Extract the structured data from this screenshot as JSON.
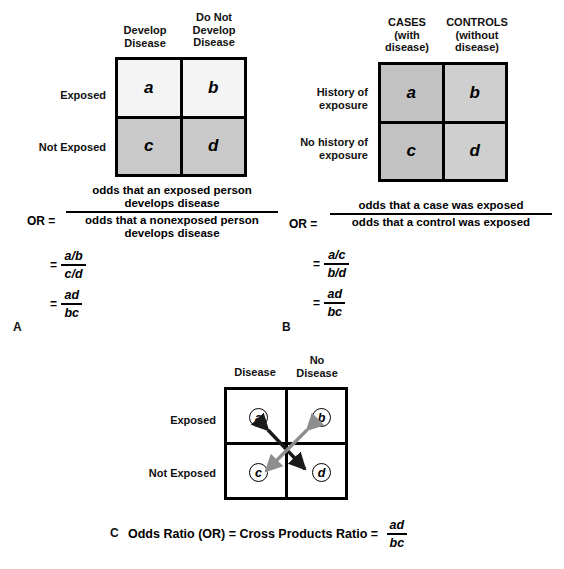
{
  "figure": {
    "panels": [
      {
        "id": "A",
        "letter": "A",
        "table": {
          "col_headers": [
            "Develop\nDisease",
            "Do Not\nDevelop\nDisease"
          ],
          "col_header_lines": [
            [
              "Develop",
              "Disease"
            ],
            [
              "Do Not",
              "Develop",
              "Disease"
            ]
          ],
          "row_headers": [
            "Exposed",
            "Not Exposed"
          ],
          "cells": [
            [
              "a",
              "b"
            ],
            [
              "c",
              "d"
            ]
          ],
          "cell_colors": [
            [
              "#f4f4f4",
              "#f4f4f4"
            ],
            [
              "#c9c9c9",
              "#c9c9c9"
            ]
          ]
        },
        "formula": {
          "or_label": "OR  =",
          "numerator_lines": [
            "odds that an exposed person",
            "develops disease"
          ],
          "denominator_lines": [
            "odds that a nonexposed person",
            "develops disease"
          ],
          "steps": [
            {
              "eq": "=",
              "num": "a/b",
              "den": "c/d"
            },
            {
              "eq": "=",
              "num": "ad",
              "den": "bc"
            }
          ]
        }
      },
      {
        "id": "B",
        "letter": "B",
        "table": {
          "col_header_lines": [
            [
              "CASES",
              "(with",
              "disease)"
            ],
            [
              "CONTROLS",
              "(without",
              "disease)"
            ]
          ],
          "row_header_lines": [
            [
              "History of",
              "exposure"
            ],
            [
              "No history of",
              "exposure"
            ]
          ],
          "cells": [
            [
              "a",
              "b"
            ],
            [
              "c",
              "d"
            ]
          ],
          "cell_colors": [
            [
              "#c2c2c2",
              "#cfcfcf"
            ],
            [
              "#c2c2c2",
              "#cfcfcf"
            ]
          ]
        },
        "formula": {
          "or_label": "OR  =",
          "numerator_lines": [
            "odds that a case was exposed"
          ],
          "denominator_lines": [
            "odds that a control was exposed"
          ],
          "steps": [
            {
              "eq": "=",
              "num": "a/c",
              "den": "b/d"
            },
            {
              "eq": "=",
              "num": "ad",
              "den": "bc"
            }
          ]
        }
      },
      {
        "id": "C",
        "letter": "C",
        "table": {
          "col_header_lines": [
            [
              "Disease"
            ],
            [
              "No",
              "Disease"
            ]
          ],
          "row_headers": [
            "Exposed",
            "Not Exposed"
          ],
          "cells": [
            [
              "a",
              "b"
            ],
            [
              "c",
              "d"
            ]
          ],
          "cell_colors": [
            [
              "#ffffff",
              "#ffffff"
            ],
            [
              "#ffffff",
              "#ffffff"
            ]
          ]
        },
        "caption": {
          "text": "Odds Ratio (OR) = Cross Products Ratio =",
          "frac_num": "ad",
          "frac_den": "bc"
        },
        "arrows": [
          {
            "name": "a-to-d-cross-product",
            "color": "#1a1a1a"
          },
          {
            "name": "b-to-c-cross-product",
            "color": "#8e8e8e"
          }
        ]
      }
    ]
  },
  "footer": {
    "partial_text": ""
  }
}
